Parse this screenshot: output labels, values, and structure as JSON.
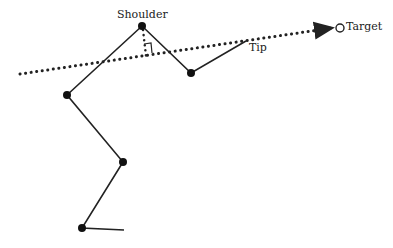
{
  "diagram": {
    "labels": {
      "shoulder": "Shoulder",
      "tip": "Tip",
      "target": "Target"
    },
    "joints": [
      {
        "name": "shoulder",
        "x": 142,
        "y": 26
      },
      {
        "name": "forearm-elbow",
        "x": 191,
        "y": 73
      },
      {
        "name": "tip",
        "x": 246,
        "y": 41
      },
      {
        "name": "upper-left-joint",
        "x": 67,
        "y": 95
      },
      {
        "name": "middle-joint",
        "x": 123,
        "y": 162
      },
      {
        "name": "bottom-joint",
        "x": 82,
        "y": 228
      },
      {
        "name": "base-end",
        "x": 124,
        "y": 230
      }
    ],
    "target": {
      "x": 340,
      "y": 28
    },
    "colors": {
      "ink": "#222222"
    }
  }
}
